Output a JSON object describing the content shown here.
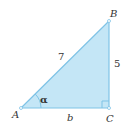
{
  "diagram": {
    "type": "right-triangle",
    "colors": {
      "fill": "#c4e6f6",
      "stroke": "#7fc3e6",
      "text": "#333333"
    },
    "vertices": [
      {
        "label": "A",
        "x": 21,
        "y": 108
      },
      {
        "label": "B",
        "x": 109,
        "y": 21
      },
      {
        "label": "C",
        "x": 109,
        "y": 108
      }
    ],
    "sides": {
      "hypotenuse_AB": "7",
      "side_BC": "5",
      "side_AC": "b"
    },
    "angle": {
      "vertex": "A",
      "label": "α"
    },
    "right_angle_vertex": "C"
  }
}
